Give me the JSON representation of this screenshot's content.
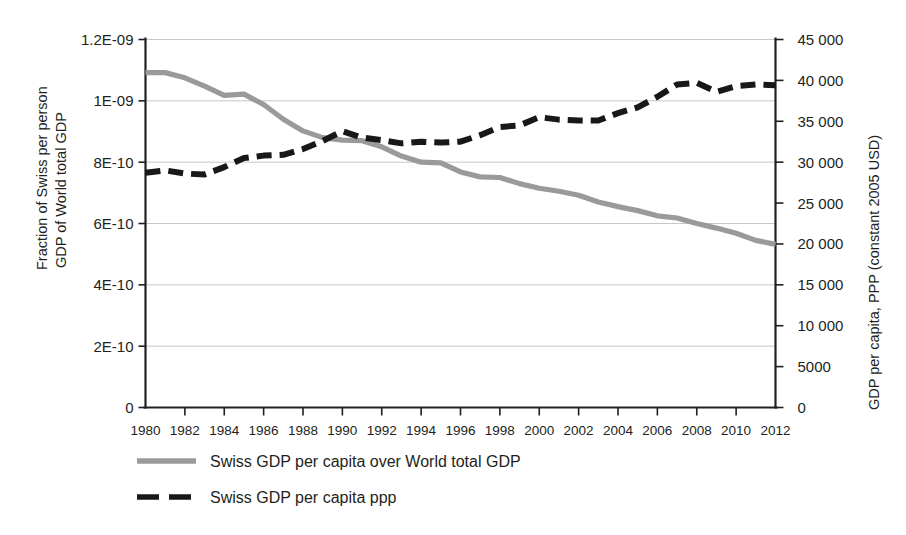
{
  "chart_data": {
    "type": "line",
    "title": "",
    "subtitle": "",
    "xlabel": "",
    "ylabel": "Fraction of Swiss per person GDP of World total GDP",
    "ylabel_line1": "Fraction of Swiss per person",
    "ylabel_line2": "GDP of World total GDP",
    "y2label": "GDP per capita, PPP (constant 2005 USD)",
    "grid": true,
    "legend_position": "bottom-left",
    "xlim": [
      1980,
      2012
    ],
    "ylim": [
      0,
      1.2e-09
    ],
    "y2lim": [
      0,
      45000
    ],
    "x_ticks": [
      1980,
      1982,
      1984,
      1986,
      1988,
      1990,
      1992,
      1994,
      1996,
      1998,
      2000,
      2002,
      2004,
      2006,
      2008,
      2010,
      2012
    ],
    "x_tick_labels": [
      "1980",
      "1982",
      "1984",
      "1986",
      "1988",
      "1990",
      "1992",
      "1994",
      "1996",
      "1998",
      "2000",
      "2002",
      "2004",
      "2006",
      "2008",
      "2010",
      "2012"
    ],
    "y_ticks": [
      0,
      2e-10,
      4e-10,
      6e-10,
      8e-10,
      1e-09,
      1.2e-09
    ],
    "y_tick_labels": [
      "0",
      "2E-10",
      "4E-10",
      "6E-10",
      "8E-10",
      "1E-09",
      "1.2E-09"
    ],
    "y2_ticks": [
      0,
      5000,
      10000,
      15000,
      20000,
      25000,
      30000,
      35000,
      40000,
      45000
    ],
    "y2_tick_labels": [
      "0",
      "5000",
      "10 000",
      "15 000",
      "20 000",
      "25 000",
      "30 000",
      "35 000",
      "40 000",
      "45 000"
    ],
    "x": [
      1980,
      1981,
      1982,
      1983,
      1984,
      1985,
      1986,
      1987,
      1988,
      1989,
      1990,
      1991,
      1992,
      1993,
      1994,
      1995,
      1996,
      1997,
      1998,
      1999,
      2000,
      2001,
      2002,
      2003,
      2004,
      2005,
      2006,
      2007,
      2008,
      2009,
      2010,
      2011,
      2012
    ],
    "series": [
      {
        "name": "Swiss GDP per capita over World total GDP",
        "axis": "left",
        "style": "solid",
        "color": "#9a9a9a",
        "values": [
          1.092e-09,
          1.092e-09,
          1.075e-09,
          1.048e-09,
          1.018e-09,
          1.022e-09,
          9.88e-10,
          9.4e-10,
          9.02e-10,
          8.8e-10,
          8.72e-10,
          8.7e-10,
          8.5e-10,
          8.2e-10,
          8e-10,
          7.98e-10,
          7.68e-10,
          7.52e-10,
          7.5e-10,
          7.3e-10,
          7.15e-10,
          7.05e-10,
          6.92e-10,
          6.7e-10,
          6.55e-10,
          6.42e-10,
          6.25e-10,
          6.18e-10,
          6e-10,
          5.85e-10,
          5.68e-10,
          5.45e-10,
          5.32e-10
        ]
      },
      {
        "name": "Swiss GDP per capita ppp",
        "axis": "right",
        "style": "dashed",
        "color": "#181818",
        "values": [
          28700,
          29000,
          28600,
          28500,
          29400,
          30500,
          30800,
          30900,
          31600,
          32600,
          33800,
          33000,
          32700,
          32300,
          32500,
          32400,
          32500,
          33300,
          34300,
          34500,
          35500,
          35200,
          35100,
          35100,
          36000,
          36700,
          38000,
          39500,
          39700,
          38600,
          39300,
          39500,
          39400
        ]
      }
    ]
  },
  "legend": {
    "entries": [
      {
        "label": "Swiss GDP per capita over World total GDP",
        "style": "solid",
        "color": "#9a9a9a"
      },
      {
        "label": "Swiss GDP per capita ppp",
        "style": "dashed",
        "color": "#181818"
      }
    ]
  }
}
